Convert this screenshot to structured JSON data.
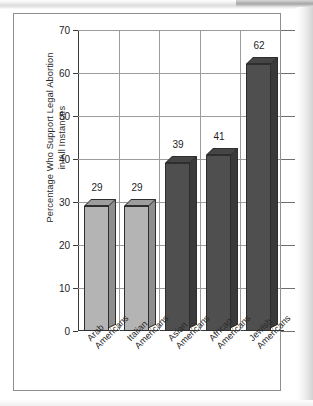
{
  "figure": {
    "y_axis_title": "Percentage Who Support Legal Abortion\nin All Instances"
  },
  "chart_data": {
    "type": "bar",
    "title": "",
    "subtitle": "",
    "xlabel": "",
    "ylabel": "Percentage Who Support Legal Abortion in All Instances",
    "ylim": [
      0,
      70
    ],
    "ytick_step": 10,
    "ytick_labels": [
      "0",
      "10",
      "20",
      "30",
      "40",
      "50",
      "60",
      "70"
    ],
    "ytick_values": [
      0,
      10,
      20,
      30,
      40,
      50,
      60,
      70
    ],
    "grid": "both",
    "legend": "none",
    "style": "3d-bar",
    "categories": [
      "Arab\nAmericans",
      "Italian\nAmericans",
      "Asian\nAmericans",
      "African\nAmericans",
      "Jewish\nAmericans"
    ],
    "values": [
      29,
      29,
      39,
      41,
      62
    ],
    "value_labels": [
      "29",
      "29",
      "39",
      "41",
      "62"
    ],
    "bar_colors": [
      "#b4b4b4",
      "#b4b4b4",
      "#4f4f4f",
      "#4f4f4f",
      "#4f4f4f"
    ],
    "bar_shades": [
      "light",
      "light",
      "dark",
      "dark",
      "dark"
    ]
  },
  "colors": {
    "bar_light": "#b4b4b4",
    "bar_dark": "#4f4f4f",
    "grid": "#9c9c9c",
    "axis": "#3a3a3a",
    "frame": "#8e8e8e",
    "text": "#2a2a2a"
  }
}
